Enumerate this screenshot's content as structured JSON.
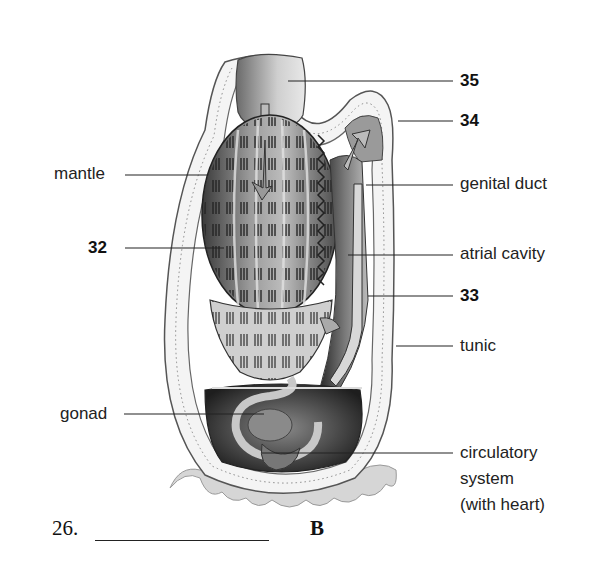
{
  "diagram": {
    "labels": {
      "mantle": "mantle",
      "genital_duct": "genital duct",
      "atrial_cavity": "atrial cavity",
      "tunic": "tunic",
      "gonad": "gonad",
      "circulatory_line1": "circulatory",
      "circulatory_line2": "system",
      "circulatory_line3": "(with heart)"
    },
    "numbered_callouts": {
      "n35": "35",
      "n34": "34",
      "n32": "32",
      "n33": "33"
    }
  },
  "caption": {
    "question_number": "26.",
    "answer_blank": "",
    "figure_letter": "B"
  }
}
